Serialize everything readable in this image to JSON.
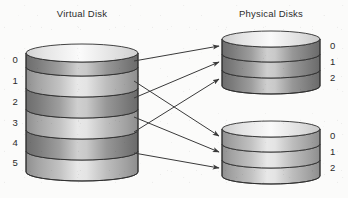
{
  "diagram": {
    "kind": "block-mapping-diagram",
    "background_color": "#fbfbfa",
    "ink_color": "#2b2b2b",
    "titles": {
      "virtual": "Virtual Disk",
      "physical": "Physical Disks"
    },
    "virtual_disk": {
      "name": "Virtual Disk",
      "block_labels": [
        "0",
        "1",
        "2",
        "3",
        "4",
        "5"
      ],
      "band_count": 6,
      "geometry": {
        "cx": 82,
        "top_y": 44,
        "rx": 56,
        "ry": 9,
        "band_h": 21
      },
      "band_shades": [
        "dark",
        "light",
        "dark",
        "light",
        "dark",
        "light"
      ]
    },
    "physical_disks": [
      {
        "name": "Physical Disk 0",
        "block_labels": [
          "0",
          "1",
          "2"
        ],
        "band_count": 3,
        "geometry": {
          "cx": 271,
          "top_y": 37,
          "rx": 49,
          "ry": 8,
          "band_h": 16
        },
        "band_shades": [
          "dark",
          "dark",
          "dark"
        ]
      },
      {
        "name": "Physical Disk 1",
        "block_labels": [
          "0",
          "1",
          "2"
        ],
        "band_count": 3,
        "geometry": {
          "cx": 271,
          "top_y": 127,
          "rx": 49,
          "ry": 8,
          "band_h": 16
        },
        "band_shades": [
          "light",
          "light",
          "light"
        ]
      }
    ],
    "mappings": [
      {
        "from_block": "0",
        "to_disk": "Physical Disk 0",
        "to_block": "0",
        "x1": 134,
        "y1": 61,
        "x2": 219,
        "y2": 46
      },
      {
        "from_block": "1",
        "to_disk": "Physical Disk 1",
        "to_block": "0",
        "x1": 134,
        "y1": 81,
        "x2": 219,
        "y2": 136
      },
      {
        "from_block": "2",
        "to_disk": "Physical Disk 0",
        "to_block": "1",
        "x1": 134,
        "y1": 98,
        "x2": 219,
        "y2": 62
      },
      {
        "from_block": "3",
        "to_disk": "Physical Disk 1",
        "to_block": "1",
        "x1": 134,
        "y1": 117,
        "x2": 219,
        "y2": 152
      },
      {
        "from_block": "4",
        "to_disk": "Physical Disk 0",
        "to_block": "2",
        "x1": 134,
        "y1": 132,
        "x2": 219,
        "y2": 79
      },
      {
        "from_block": "5",
        "to_disk": "Physical Disk 1",
        "to_block": "2",
        "x1": 134,
        "y1": 153,
        "x2": 219,
        "y2": 168
      }
    ],
    "arrow_count": 6
  }
}
